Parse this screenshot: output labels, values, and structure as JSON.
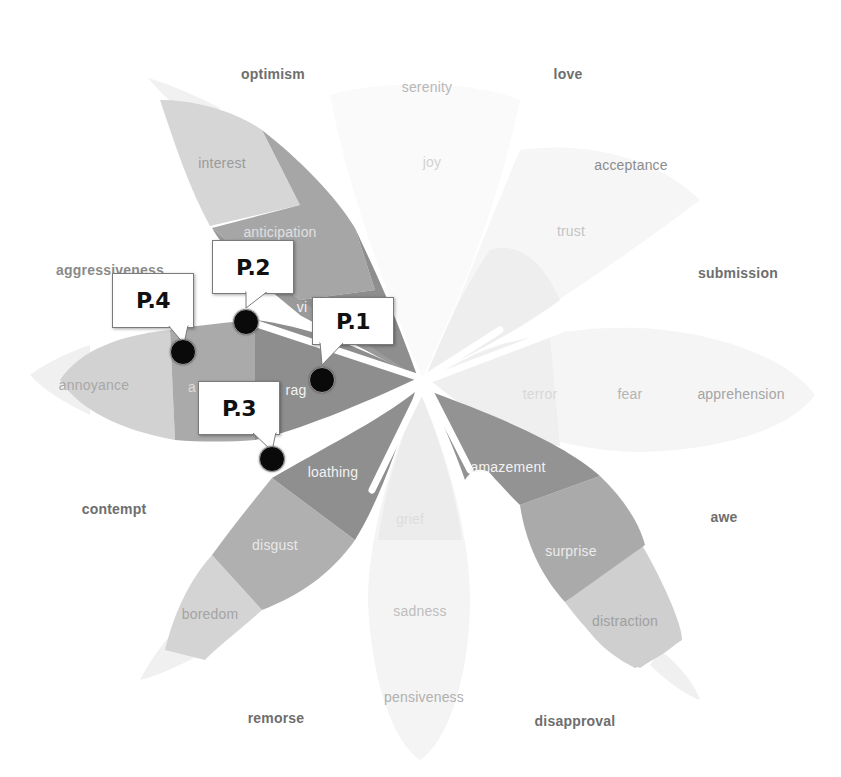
{
  "diagram": {
    "type": "plutchik-wheel-of-emotions",
    "center": {
      "x": 422,
      "y": 380
    },
    "colors": {
      "background": "#ffffff",
      "petal_dark": "#8c8c8c",
      "petal_mid": "#a8a8a8",
      "petal_light": "#c6c6c6",
      "petal_faint": "#e4e4e4",
      "petal_ghost": "#f1f1f1",
      "marker": "#0a0a0a",
      "outer_label": "#6e6e6e"
    }
  },
  "outer_labels": {
    "optimism": "optimism",
    "love": "love",
    "submission": "submission",
    "awe": "awe",
    "disapproval": "disapproval",
    "remorse": "remorse",
    "contempt": "contempt",
    "aggressiveness": "aggressiveness"
  },
  "petals": {
    "anticipation": {
      "outer": "interest",
      "middle": "anticipation",
      "inner": "vigilance"
    },
    "joy": {
      "outer": "serenity",
      "middle": "joy",
      "inner": "ecstasy"
    },
    "trust": {
      "outer": "acceptance",
      "middle": "trust",
      "inner": "admiration"
    },
    "fear": {
      "outer": "apprehension",
      "middle": "fear",
      "inner": "terror"
    },
    "surprise": {
      "outer": "distraction",
      "middle": "surprise",
      "inner": "amazement"
    },
    "sadness": {
      "outer": "pensiveness",
      "middle": "sadness",
      "inner": "grief"
    },
    "disgust": {
      "outer": "boredom",
      "middle": "disgust",
      "inner": "loathing"
    },
    "anger": {
      "outer": "annoyance",
      "middle": "anger",
      "inner": "rage"
    }
  },
  "visible_text": {
    "vigilance_partial": "vi",
    "anger_partial": "a",
    "rage_partial": "rag",
    "terror_partial": "terror",
    "grief": "grief"
  },
  "callouts": [
    {
      "id": "P.1",
      "label": "P.1",
      "marker": {
        "x": 322,
        "y": 380
      }
    },
    {
      "id": "P.2",
      "label": "P.2",
      "marker": {
        "x": 246,
        "y": 322
      }
    },
    {
      "id": "P.3",
      "label": "P.3",
      "marker": {
        "x": 272,
        "y": 459
      }
    },
    {
      "id": "P.4",
      "label": "P.4",
      "marker": {
        "x": 183,
        "y": 352
      }
    }
  ]
}
